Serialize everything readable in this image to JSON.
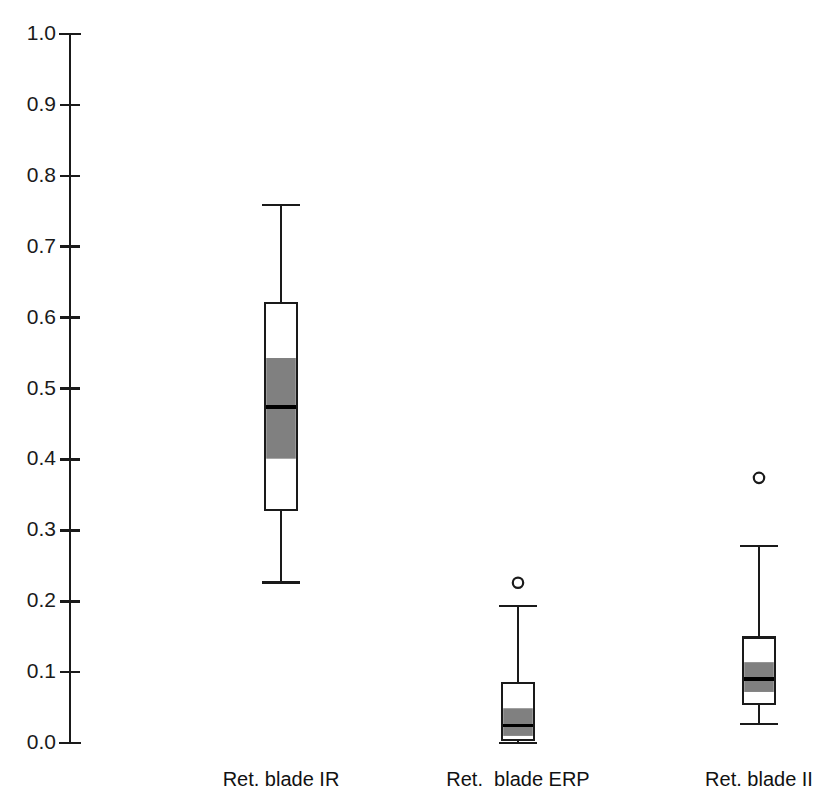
{
  "chart_data": {
    "type": "box",
    "title": "",
    "xlabel": "",
    "ylabel": "",
    "ylim": [
      0.0,
      1.0
    ],
    "grid": false,
    "legend": null,
    "notched": true,
    "y_ticks": [
      "0.0",
      "0.1",
      "0.2",
      "0.3",
      "0.4",
      "0.5",
      "0.6",
      "0.7",
      "0.8",
      "0.9",
      "1.0"
    ],
    "y_tick_values": [
      0.0,
      0.1,
      0.2,
      0.3,
      0.4,
      0.5,
      0.6,
      0.7,
      0.8,
      0.9,
      1.0
    ],
    "categories": [
      "Ret. blade IR",
      "Ret.  blade ERP",
      "Ret. blade II"
    ],
    "boxes": [
      {
        "label": "Ret. blade IR",
        "whisker_low": 0.226,
        "q1": 0.329,
        "notch_low": 0.401,
        "median": 0.474,
        "notch_high": 0.543,
        "q3": 0.621,
        "whisker_high": 0.759,
        "outliers": []
      },
      {
        "label": "Ret.  blade ERP",
        "whisker_low": 0.0,
        "q1": 0.004,
        "notch_low": 0.01,
        "median": 0.025,
        "notch_high": 0.049,
        "q3": 0.085,
        "whisker_high": 0.193,
        "outliers": [
          0.226
        ]
      },
      {
        "label": "Ret. blade II",
        "whisker_low": 0.027,
        "q1": 0.055,
        "notch_low": 0.072,
        "median": 0.09,
        "notch_high": 0.114,
        "q3": 0.149,
        "whisker_high": 0.278,
        "outliers": [
          0.374
        ]
      }
    ],
    "colors": {
      "axis": "#1a1a1a",
      "box_outline": "#1a1a1a",
      "box_fill": "#ffffff",
      "notch_fill": "#808080",
      "median": "#000000",
      "outlier_stroke": "#1a1a1a"
    }
  },
  "axis": {
    "x_px": 70,
    "y_top_px": 34,
    "y_bottom_px": 743,
    "tick_len": 11
  },
  "geometry": {
    "box_half_width": 16,
    "whisker_cap_half_width": 19,
    "centers_px": [
      281,
      518,
      759
    ],
    "label_y_px": 768
  }
}
